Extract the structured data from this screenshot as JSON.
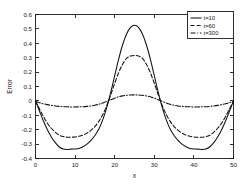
{
  "chart_data": {
    "type": "line",
    "title": "",
    "xlabel": "x",
    "ylabel": "Error",
    "xlim": [
      0,
      50
    ],
    "ylim": [
      -0.4,
      0.6
    ],
    "xticks": [
      "0",
      "10",
      "20",
      "30",
      "40",
      "50"
    ],
    "xtick_values": [
      0,
      10,
      20,
      30,
      40,
      50
    ],
    "yticks": [
      "0.6",
      "0.5",
      "0.4",
      "0.3",
      "0.2",
      "0.1",
      "0",
      "-0.1",
      "-0.2",
      "-0.3",
      "-0.4"
    ],
    "ytick_values": [
      0.6,
      0.5,
      0.4,
      0.3,
      0.2,
      0.1,
      0,
      -0.1,
      -0.2,
      -0.3,
      -0.4
    ],
    "grid": false,
    "legend_position": "top-right",
    "series": [
      {
        "name": "t=10",
        "style": "solid",
        "color": "#101010",
        "x": [
          0,
          1,
          2,
          3,
          4,
          5,
          6,
          7,
          8,
          9,
          10,
          11,
          12,
          13,
          14,
          15,
          16,
          17,
          18,
          19,
          20,
          21,
          22,
          23,
          24,
          25,
          26,
          27,
          28,
          29,
          30,
          31,
          32,
          33,
          34,
          35,
          36,
          37,
          38,
          39,
          40,
          41,
          42,
          43,
          44,
          45,
          46,
          47,
          48,
          49,
          50
        ],
        "values": [
          0.0,
          -0.07,
          -0.14,
          -0.2,
          -0.25,
          -0.29,
          -0.32,
          -0.334,
          -0.337,
          -0.335,
          -0.334,
          -0.33,
          -0.318,
          -0.3,
          -0.274,
          -0.24,
          -0.195,
          -0.13,
          -0.045,
          0.06,
          0.175,
          0.29,
          0.39,
          0.465,
          0.51,
          0.525,
          0.51,
          0.465,
          0.39,
          0.29,
          0.175,
          0.06,
          -0.045,
          -0.13,
          -0.195,
          -0.24,
          -0.274,
          -0.3,
          -0.318,
          -0.33,
          -0.334,
          -0.335,
          -0.337,
          -0.334,
          -0.32,
          -0.29,
          -0.25,
          -0.2,
          -0.14,
          -0.07,
          0.0
        ]
      },
      {
        "name": "t=60",
        "style": "dashed",
        "color": "#101010",
        "x": [
          0,
          1,
          2,
          3,
          4,
          5,
          6,
          7,
          8,
          9,
          10,
          11,
          12,
          13,
          14,
          15,
          16,
          17,
          18,
          19,
          20,
          21,
          22,
          23,
          24,
          25,
          26,
          27,
          28,
          29,
          30,
          31,
          32,
          33,
          34,
          35,
          36,
          37,
          38,
          39,
          40,
          41,
          42,
          43,
          44,
          45,
          46,
          47,
          48,
          49,
          50
        ],
        "values": [
          0.0,
          -0.055,
          -0.108,
          -0.155,
          -0.19,
          -0.218,
          -0.238,
          -0.248,
          -0.252,
          -0.252,
          -0.25,
          -0.246,
          -0.238,
          -0.224,
          -0.204,
          -0.178,
          -0.142,
          -0.094,
          -0.032,
          0.042,
          0.122,
          0.196,
          0.255,
          0.295,
          0.312,
          0.315,
          0.312,
          0.295,
          0.255,
          0.196,
          0.122,
          0.042,
          -0.032,
          -0.094,
          -0.142,
          -0.178,
          -0.204,
          -0.224,
          -0.238,
          -0.246,
          -0.25,
          -0.252,
          -0.252,
          -0.248,
          -0.238,
          -0.218,
          -0.19,
          -0.155,
          -0.108,
          -0.055,
          0.0
        ]
      },
      {
        "name": "t=300",
        "style": "dashdot",
        "color": "#101010",
        "x": [
          0,
          1,
          2,
          3,
          4,
          5,
          6,
          7,
          8,
          9,
          10,
          11,
          12,
          13,
          14,
          15,
          16,
          17,
          18,
          19,
          20,
          21,
          22,
          23,
          24,
          25,
          26,
          27,
          28,
          29,
          30,
          31,
          32,
          33,
          34,
          35,
          36,
          37,
          38,
          39,
          40,
          41,
          42,
          43,
          44,
          45,
          46,
          47,
          48,
          49,
          50
        ],
        "values": [
          -0.004,
          -0.012,
          -0.02,
          -0.026,
          -0.031,
          -0.035,
          -0.038,
          -0.04,
          -0.041,
          -0.042,
          -0.042,
          -0.041,
          -0.04,
          -0.038,
          -0.035,
          -0.03,
          -0.023,
          -0.014,
          -0.003,
          0.008,
          0.019,
          0.028,
          0.035,
          0.039,
          0.041,
          0.042,
          0.041,
          0.039,
          0.035,
          0.028,
          0.019,
          0.008,
          -0.003,
          -0.014,
          -0.023,
          -0.03,
          -0.035,
          -0.038,
          -0.04,
          -0.041,
          -0.042,
          -0.042,
          -0.041,
          -0.04,
          -0.038,
          -0.035,
          -0.031,
          -0.026,
          -0.02,
          -0.012,
          -0.004
        ]
      }
    ],
    "annotations": {
      "peak_t10": 0.525,
      "trough_t10": -0.337,
      "peak_t60": 0.315,
      "trough_t60": -0.252,
      "peak_t300": 0.042,
      "trough_t300": -0.042
    }
  },
  "legend": {
    "entries": [
      {
        "label": "t=10"
      },
      {
        "label": "t=60"
      },
      {
        "label": "t=300"
      }
    ]
  }
}
